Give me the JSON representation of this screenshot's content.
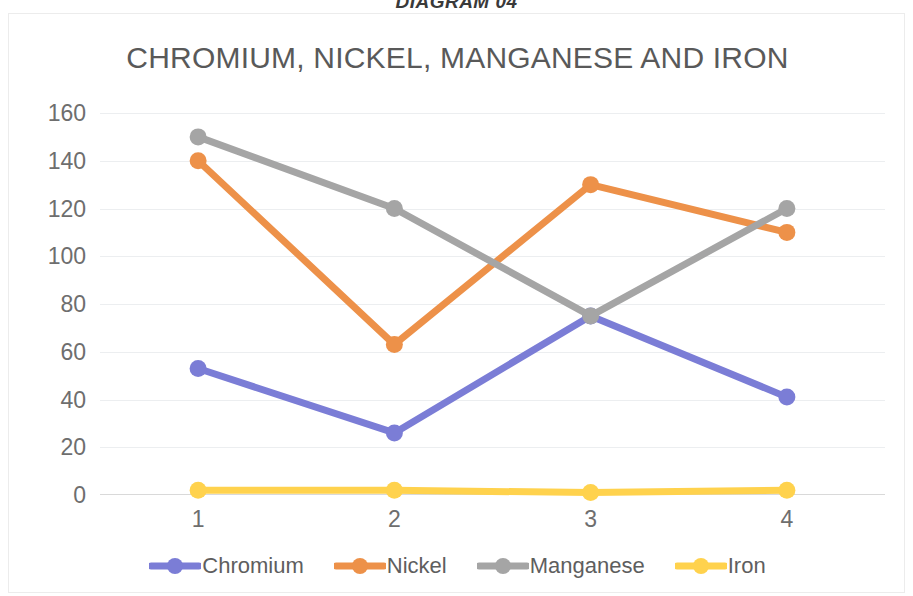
{
  "document": {
    "heading": "DIAGRAM 04"
  },
  "chart_data": {
    "type": "line",
    "title": "CHROMIUM, NICKEL, MANGANESE AND IRON",
    "xlabel": "",
    "ylabel": "",
    "categories": [
      "1",
      "2",
      "3",
      "4"
    ],
    "ylim": [
      0,
      160
    ],
    "ytick_labels": [
      "0",
      "20",
      "40",
      "60",
      "80",
      "100",
      "120",
      "140",
      "160"
    ],
    "ytick_values": [
      0,
      20,
      40,
      60,
      80,
      100,
      120,
      140,
      160
    ],
    "grid": true,
    "legend_position": "bottom",
    "series": [
      {
        "name": "Chromium",
        "color": "#7B7DD6",
        "values": [
          53,
          26,
          75,
          41
        ]
      },
      {
        "name": "Nickel",
        "color": "#ED9149",
        "values": [
          140,
          63,
          130,
          110
        ]
      },
      {
        "name": "Manganese",
        "color": "#A5A5A5",
        "values": [
          150,
          120,
          75,
          120
        ]
      },
      {
        "name": "Iron",
        "color": "#FFD24D",
        "values": [
          2,
          2,
          1,
          2
        ]
      }
    ]
  }
}
